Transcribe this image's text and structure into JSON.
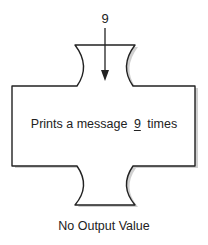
{
  "diagram": {
    "input": {
      "value": "9",
      "arrow": "down-arrow"
    },
    "function_block": {
      "text_prefix": "Prints a message",
      "parameter_value": "9",
      "text_suffix": "times"
    },
    "output": {
      "label": "No Output Value"
    },
    "colors": {
      "stroke": "#222222",
      "fill": "#ffffff",
      "shadow": "#c8c8c8",
      "text": "#222222"
    }
  }
}
